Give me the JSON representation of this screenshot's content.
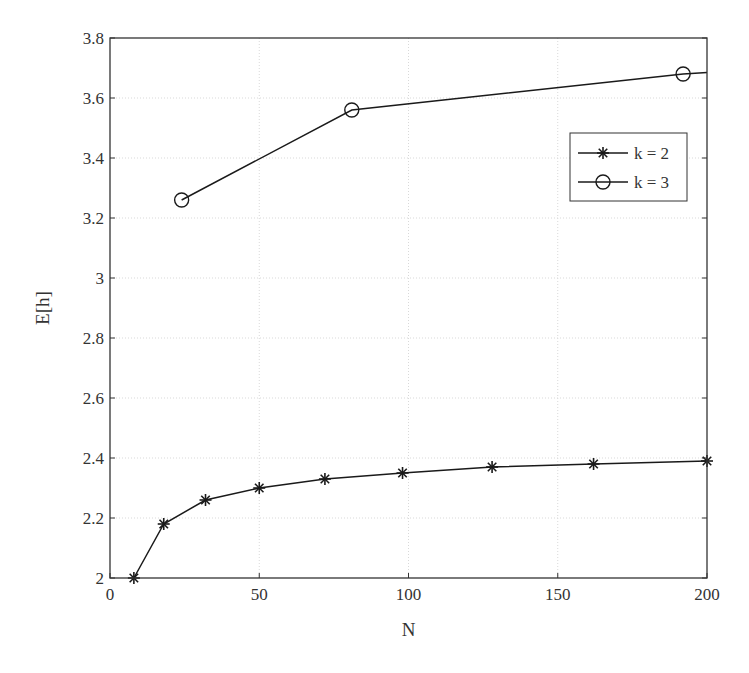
{
  "chart_data": {
    "type": "line",
    "title": "",
    "xlabel": "N",
    "ylabel": "E[h]",
    "xlim": [
      0,
      200
    ],
    "ylim": [
      2,
      3.8
    ],
    "xticks": [
      0,
      50,
      100,
      150,
      200
    ],
    "xtick_labels": [
      "0",
      "50",
      "100",
      "150",
      "200"
    ],
    "yticks": [
      2,
      2.2,
      2.4,
      2.6,
      2.8,
      3,
      3.2,
      3.4,
      3.6,
      3.8
    ],
    "ytick_labels": [
      "2",
      "2.2",
      "2.4",
      "2.6",
      "2.8",
      "3",
      "3.2",
      "3.4",
      "3.6",
      "3.8"
    ],
    "grid": true,
    "legend_position": "upper right (inside)",
    "series": [
      {
        "name": "k = 2",
        "marker": "star",
        "x": [
          8,
          18,
          32,
          50,
          72,
          98,
          128,
          162,
          200
        ],
        "y": [
          2.0,
          2.18,
          2.26,
          2.3,
          2.33,
          2.35,
          2.37,
          2.38,
          2.39
        ]
      },
      {
        "name": "k = 3",
        "marker": "circle",
        "x": [
          24,
          81,
          192
        ],
        "y": [
          3.26,
          3.56,
          3.68
        ],
        "line_extends_to_x": 200,
        "line_end_y": 3.685
      }
    ]
  },
  "colors": {
    "line": "#1a1a1a",
    "grid": "#d9d9d9",
    "axis": "#333333",
    "background": "#ffffff"
  }
}
